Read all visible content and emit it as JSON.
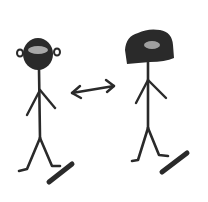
{
  "scene": {
    "description": "Hand-drawn sketch of two stick figures with a double-headed arrow between them",
    "background": "#ffffff",
    "ink_color": "#2a2a2a",
    "highlight_color": "#bdbdbd",
    "figures": [
      {
        "name": "left-figure",
        "hair": "short round",
        "has_ears": true
      },
      {
        "name": "right-figure",
        "hair": "large bushy",
        "has_ears": false
      }
    ],
    "arrow": {
      "type": "double-headed",
      "direction": "horizontal"
    }
  }
}
